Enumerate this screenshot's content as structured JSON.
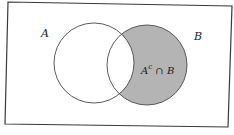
{
  "diagram": {
    "type": "venn",
    "universe": {
      "corners": [
        [
          8,
          2
        ],
        [
          232,
          6
        ],
        [
          228,
          127
        ],
        [
          5,
          124
        ]
      ]
    },
    "sets": [
      {
        "name": "A",
        "label": "A",
        "cx": 94,
        "cy": 63,
        "r": 40,
        "label_pos": [
          41,
          36
        ]
      },
      {
        "name": "B",
        "label": "B",
        "cx": 147,
        "cy": 65,
        "r": 40,
        "label_pos": [
          194,
          40
        ]
      }
    ],
    "shaded_region": {
      "expression": "A^c ∩ B",
      "fill": "#b4b4b4"
    },
    "region_label": {
      "base": "A",
      "sup": "c",
      "rest": " ∩ B"
    },
    "colors": {
      "stroke": "#3a3a3a",
      "background": "#ffffff",
      "shade": "#b4b4b4"
    }
  }
}
